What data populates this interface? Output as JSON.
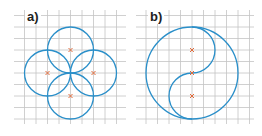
{
  "figures": [
    {
      "label": "a)",
      "description": "four circles arranged around a center point"
    },
    {
      "label": "b)",
      "description": "large circle with S-curve dividing it (yin-yang style)"
    }
  ],
  "colors": {
    "grid": "#b8b8b8",
    "curve": "#2a8fc9",
    "mark": "#e06a3a"
  }
}
